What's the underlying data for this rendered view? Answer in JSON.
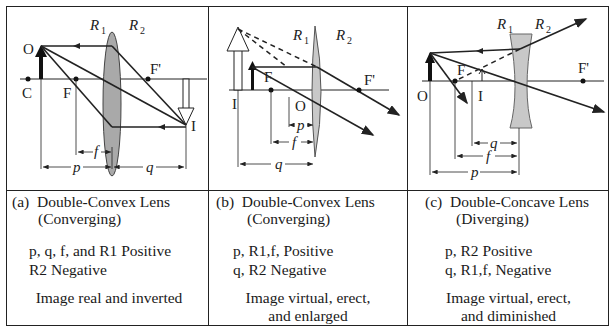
{
  "panels": [
    {
      "id": "a",
      "caption_label": "(a)",
      "caption_title": "Double-Convex Lens",
      "caption_type": "(Converging)",
      "signs_line1": "p, q, f, and R1  Positive",
      "signs_line2": "R2  Negative",
      "result_line1": "Image real and inverted",
      "result_line2": "",
      "diagram_labels": {
        "O": "O",
        "C": "C",
        "F": "F",
        "Fp": "F'",
        "I": "I",
        "R1": "R",
        "R1_sub": "1",
        "R2": "R",
        "R2_sub": "2",
        "f": "f",
        "p": "p",
        "q": "q"
      }
    },
    {
      "id": "b",
      "caption_label": "(b)",
      "caption_title": "Double-Convex Lens",
      "caption_type": "(Converging)",
      "signs_line1": "p, R1,f, Positive",
      "signs_line2": "q, R2 Negative",
      "result_line1": "Image virtual, erect,",
      "result_line2": "and enlarged",
      "diagram_labels": {
        "O": "O",
        "F": "F",
        "Fp": "F'",
        "I": "I",
        "R1": "R",
        "R1_sub": "1",
        "R2": "R",
        "R2_sub": "2",
        "f": "f",
        "p": "p",
        "q": "q"
      }
    },
    {
      "id": "c",
      "caption_label": "(c)",
      "caption_title": "Double-Concave Lens",
      "caption_type": "(Diverging)",
      "signs_line1": "p, R2 Positive",
      "signs_line2": "q, R1,f, Negative",
      "result_line1": "Image virtual, erect,",
      "result_line2": "and diminished",
      "diagram_labels": {
        "O": "O",
        "F": "F",
        "Fp": "F'",
        "I": "I",
        "R1": "R",
        "R1_sub": "1",
        "R2": "R",
        "R2_sub": "2",
        "f": "f",
        "p": "p",
        "q": "q"
      }
    }
  ],
  "colors": {
    "line": "#222222",
    "lens_fill": "#a9a9a9",
    "lens_fill_light": "#c8c8c8"
  }
}
